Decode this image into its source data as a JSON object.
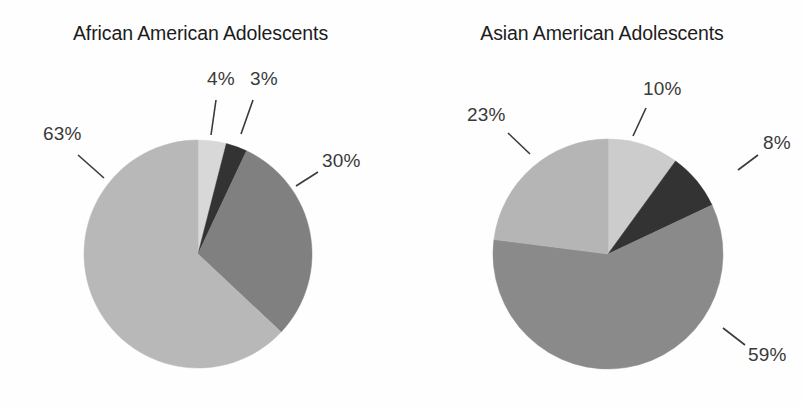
{
  "figure": {
    "background_color": "#fefefe",
    "label_color": "#3a3a3a",
    "title_color": "#1c1c1c"
  },
  "chart_data": [
    {
      "type": "pie",
      "title": "African American Adolescents",
      "categories": [
        "Segment 1",
        "Segment 2",
        "Segment 3",
        "Segment 4"
      ],
      "values": [
        4,
        3,
        30,
        63
      ],
      "labels": [
        "4%",
        "3%",
        "30%",
        "63%"
      ],
      "colors": [
        "#d8d8d8",
        "#333333",
        "#808080",
        "#b8b8b8"
      ],
      "start_angle_deg": 0,
      "direction": "clockwise",
      "legend": "none",
      "grid": false,
      "xlabel": "",
      "ylabel": ""
    },
    {
      "type": "pie",
      "title": "Asian American Adolescents",
      "categories": [
        "Segment 1",
        "Segment 2",
        "Segment 3",
        "Segment 4"
      ],
      "values": [
        10,
        8,
        59,
        23
      ],
      "labels": [
        "10%",
        "8%",
        "59%",
        "23%"
      ],
      "colors": [
        "#cccccc",
        "#333333",
        "#8a8a8a",
        "#b5b5b5"
      ],
      "start_angle_deg": 0,
      "direction": "clockwise",
      "legend": "none",
      "grid": false,
      "xlabel": "",
      "ylabel": ""
    }
  ],
  "panels": [
    {
      "id": "panel-0",
      "title": "African American Adolescents",
      "center": {
        "x": 198,
        "y": 254
      },
      "radius": 114,
      "slices": [
        {
          "name": "slice-4",
          "label": "4%",
          "value": 4,
          "color": "#d8d8d8",
          "label_pos": {
            "x": 207,
            "y": 68
          },
          "leader": {
            "x1": 216,
            "y1": 100,
            "x2": 211,
            "y2": 135
          }
        },
        {
          "name": "slice-3",
          "label": "3%",
          "value": 3,
          "color": "#333333",
          "label_pos": {
            "x": 250,
            "y": 68
          },
          "leader": {
            "x1": 253,
            "y1": 100,
            "x2": 241,
            "y2": 134
          }
        },
        {
          "name": "slice-30",
          "label": "30%",
          "value": 30,
          "color": "#808080",
          "label_pos": {
            "x": 322,
            "y": 150
          },
          "leader": {
            "x1": 318,
            "y1": 172,
            "x2": 296,
            "y2": 186
          }
        },
        {
          "name": "slice-63",
          "label": "63%",
          "value": 63,
          "color": "#b8b8b8",
          "label_pos": {
            "x": 43,
            "y": 123
          },
          "leader": {
            "x1": 78,
            "y1": 155,
            "x2": 104,
            "y2": 178
          }
        }
      ]
    },
    {
      "id": "panel-1",
      "title": "Asian American Adolescents",
      "center": {
        "x": 608,
        "y": 254
      },
      "radius": 115,
      "slices": [
        {
          "name": "slice-10",
          "label": "10%",
          "value": 10,
          "color": "#cccccc",
          "label_pos": {
            "x": 643,
            "y": 78
          },
          "leader": {
            "x1": 646,
            "y1": 108,
            "x2": 633,
            "y2": 136
          }
        },
        {
          "name": "slice-8",
          "label": "8%",
          "value": 8,
          "color": "#333333",
          "label_pos": {
            "x": 763,
            "y": 132
          },
          "leader": {
            "x1": 758,
            "y1": 155,
            "x2": 738,
            "y2": 170
          }
        },
        {
          "name": "slice-59",
          "label": "59%",
          "value": 59,
          "color": "#8a8a8a",
          "label_pos": {
            "x": 748,
            "y": 344
          },
          "leader": {
            "x1": 745,
            "y1": 345,
            "x2": 723,
            "y2": 328
          }
        },
        {
          "name": "slice-23",
          "label": "23%",
          "value": 23,
          "color": "#b5b5b5",
          "label_pos": {
            "x": 467,
            "y": 104
          },
          "leader": {
            "x1": 508,
            "y1": 133,
            "x2": 530,
            "y2": 154
          }
        }
      ]
    }
  ]
}
